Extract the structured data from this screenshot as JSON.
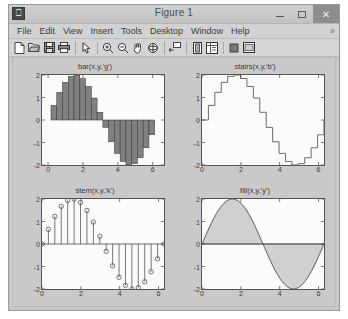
{
  "window": {
    "title": "Figure 1",
    "app_icon": "matlab-figure-icon",
    "buttons": [
      {
        "name": "minimize-button",
        "label": "–"
      },
      {
        "name": "maximize-button",
        "label": "□"
      },
      {
        "name": "close-button",
        "label": "✕"
      }
    ]
  },
  "menubar": {
    "items": [
      "File",
      "Edit",
      "View",
      "Insert",
      "Tools",
      "Desktop",
      "Window",
      "Help"
    ],
    "overflow": "»"
  },
  "toolbar": {
    "buttons": [
      {
        "name": "new-figure-icon",
        "tip": "New Figure"
      },
      {
        "name": "open-file-icon",
        "tip": "Open File"
      },
      {
        "name": "save-figure-icon",
        "tip": "Save Figure"
      },
      {
        "name": "print-figure-icon",
        "tip": "Print Figure"
      },
      {
        "name": "pointer-icon",
        "tip": "Edit Plot"
      },
      {
        "name": "zoom-in-icon",
        "tip": "Zoom In"
      },
      {
        "name": "zoom-out-icon",
        "tip": "Zoom Out"
      },
      {
        "name": "pan-icon",
        "tip": "Pan"
      },
      {
        "name": "rotate-3d-icon",
        "tip": "Rotate 3D"
      },
      {
        "name": "data-cursor-icon",
        "tip": "Data Cursor"
      },
      {
        "name": "insert-colorbar-icon",
        "tip": "Insert Colorbar"
      },
      {
        "name": "insert-legend-icon",
        "tip": "Insert Legend"
      },
      {
        "name": "hide-plot-tools-icon",
        "tip": "Hide Plot Tools"
      },
      {
        "name": "show-plot-tools-icon",
        "tip": "Show Plot Tools and Dock Figure"
      }
    ]
  },
  "chart_data": [
    {
      "type": "bar",
      "title": "bar(x,y,'g')",
      "xlabel": "",
      "ylabel": "",
      "xlim": [
        -0.35,
        6.65
      ],
      "ylim": [
        -2,
        2
      ],
      "xticks": [
        0,
        2,
        4,
        6
      ],
      "yticks": [
        -2,
        -1,
        0,
        1,
        2
      ],
      "grid": false,
      "legend": null,
      "series_color": "#808080",
      "expression": "y = 2*sin(x)",
      "x": [
        0,
        0.3307,
        0.6614,
        0.992,
        1.3227,
        1.6534,
        1.9841,
        2.3147,
        2.6454,
        2.9761,
        3.3068,
        3.6375,
        3.9681,
        4.2988,
        4.6295,
        4.9602,
        5.2908,
        5.6215,
        5.9522,
        6.2829
      ],
      "values": [
        0,
        0.6498,
        1.229,
        1.6731,
        1.9391,
        1.9992,
        1.8443,
        1.4891,
        0.9749,
        0.343,
        -0.3285,
        -0.9679,
        -1.4836,
        -1.8412,
        -1.9986,
        -1.9408,
        -1.6771,
        -1.2348,
        -0.6567,
        -0.0008
      ]
    },
    {
      "type": "line",
      "subtype": "stairs",
      "title": "stairs(x,y,'b')",
      "xlabel": "",
      "ylabel": "",
      "xlim": [
        0,
        6.2832
      ],
      "ylim": [
        -2,
        2
      ],
      "xticks": [
        0,
        2,
        4,
        6
      ],
      "yticks": [
        -2,
        -1,
        0,
        1,
        2
      ],
      "grid": false,
      "legend": null,
      "series_color": "#6b6b6b",
      "expression": "y = 2*sin(x)",
      "x": [
        0,
        0.3307,
        0.6614,
        0.992,
        1.3227,
        1.6534,
        1.9841,
        2.3147,
        2.6454,
        2.9761,
        3.3068,
        3.6375,
        3.9681,
        4.2988,
        4.6295,
        4.9602,
        5.2908,
        5.6215,
        5.9522,
        6.2829
      ],
      "values": [
        0,
        0.6498,
        1.229,
        1.6731,
        1.9391,
        1.9992,
        1.8443,
        1.4891,
        0.9749,
        0.343,
        -0.3285,
        -0.9679,
        -1.4836,
        -1.8412,
        -1.9986,
        -1.9408,
        -1.6771,
        -1.2348,
        -0.6567,
        -0.0008
      ]
    },
    {
      "type": "scatter",
      "subtype": "stem",
      "title": "stem(x,y,'k')",
      "xlabel": "",
      "ylabel": "",
      "xlim": [
        0,
        6.2832
      ],
      "ylim": [
        -2,
        2
      ],
      "xticks": [
        0,
        2,
        4,
        6
      ],
      "yticks": [
        -2,
        -1,
        0,
        1,
        2
      ],
      "grid": false,
      "legend": null,
      "series_color": "#555555",
      "expression": "y = 2*sin(x)",
      "x": [
        0,
        0.3307,
        0.6614,
        0.992,
        1.3227,
        1.6534,
        1.9841,
        2.3147,
        2.6454,
        2.9761,
        3.3068,
        3.6375,
        3.9681,
        4.2988,
        4.6295,
        4.9602,
        5.2908,
        5.6215,
        5.9522,
        6.2829
      ],
      "values": [
        0,
        0.6498,
        1.229,
        1.6731,
        1.9391,
        1.9992,
        1.8443,
        1.4891,
        0.9749,
        0.343,
        -0.3285,
        -0.9679,
        -1.4836,
        -1.8412,
        -1.9986,
        -1.9408,
        -1.6771,
        -1.2348,
        -0.6567,
        -0.0008
      ]
    },
    {
      "type": "area",
      "subtype": "fill",
      "title": "fill(x,y,'y')",
      "xlabel": "",
      "ylabel": "",
      "xlim": [
        0,
        6.2832
      ],
      "ylim": [
        -2,
        2
      ],
      "xticks": [
        0,
        2,
        4,
        6
      ],
      "yticks": [
        -2,
        -1,
        0,
        1,
        2
      ],
      "grid": false,
      "legend": null,
      "series_color": "#d0d0d0",
      "expression": "y = 2*sin(x)",
      "x": [
        0,
        0.3307,
        0.6614,
        0.992,
        1.3227,
        1.6534,
        1.9841,
        2.3147,
        2.6454,
        2.9761,
        3.3068,
        3.6375,
        3.9681,
        4.2988,
        4.6295,
        4.9602,
        5.2908,
        5.6215,
        5.9522,
        6.2829
      ],
      "values": [
        0,
        0.6498,
        1.229,
        1.6731,
        1.9391,
        1.9992,
        1.8443,
        1.4891,
        0.9749,
        0.343,
        -0.3285,
        -0.9679,
        -1.4836,
        -1.8412,
        -1.9986,
        -1.9408,
        -1.6771,
        -1.2348,
        -0.6567,
        -0.0008
      ]
    }
  ]
}
